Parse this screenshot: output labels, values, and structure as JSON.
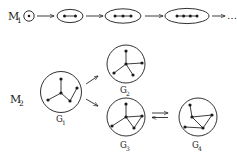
{
  "figure": {
    "background_color": "#ffffff",
    "ink_color": "#1a1a1a",
    "rows": [
      {
        "id": "M1",
        "label": "M",
        "label_subscript": "1",
        "description": "sequence of path graphs of increasing order",
        "trailing_text": "…",
        "items": [
          {
            "name": "stage-1",
            "node_count": 1,
            "shape": "small-circle"
          },
          {
            "name": "stage-2",
            "node_count": 2,
            "shape": "ellipse"
          },
          {
            "name": "stage-3",
            "node_count": 3,
            "shape": "ellipse"
          },
          {
            "name": "stage-4",
            "node_count": 4,
            "shape": "ellipse"
          }
        ],
        "arrows": [
          "arrow-1",
          "arrow-2",
          "arrow-3",
          "arrow-4"
        ]
      },
      {
        "id": "M2",
        "label": "M",
        "label_subscript": "2",
        "description": "branching graph rewriting with an equilibrium step",
        "items": [
          {
            "name": "graph-G1",
            "label": "G",
            "label_subscript": "1",
            "node_count": 5,
            "shape": "circle"
          },
          {
            "name": "graph-G2",
            "label": "G",
            "label_subscript": "2",
            "node_count": 5,
            "shape": "circle"
          },
          {
            "name": "graph-G3",
            "label": "G",
            "label_subscript": "3",
            "node_count": 5,
            "shape": "circle"
          },
          {
            "name": "graph-G4",
            "label": "G",
            "label_subscript": "4",
            "node_count": 5,
            "shape": "circle"
          }
        ],
        "arrows": [
          "branch-arrow-upper",
          "branch-arrow-lower",
          "equilibrium-arrow"
        ]
      }
    ]
  }
}
